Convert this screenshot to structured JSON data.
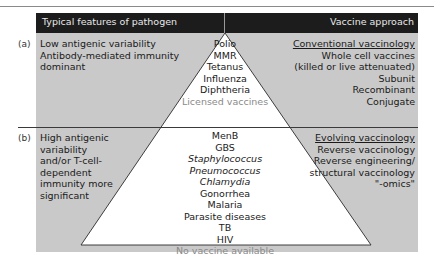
{
  "header": {
    "left": "Typical features of pathogen",
    "right": "Vaccine approach"
  },
  "rows": [
    {
      "marker": "(a)",
      "features": [
        "Low antigenic variability",
        "Antibody-mediated immunity dominant"
      ],
      "pathogens": [
        {
          "name": "Polio",
          "italic": false
        },
        {
          "name": "MMR",
          "italic": false
        },
        {
          "name": "Tetanus",
          "italic": false
        },
        {
          "name": "Influenza",
          "italic": false
        },
        {
          "name": "Diphtheria",
          "italic": false
        }
      ],
      "pathogens_footer": "Licensed vaccines",
      "approach_heading": "Conventional vaccinology",
      "approaches": [
        "Whole cell vaccines",
        "(killed or live attenuated)",
        "Subunit",
        "Recombinant",
        "Conjugate"
      ]
    },
    {
      "marker": "(b)",
      "features": [
        "High antigenic variability",
        "and/or T-cell-dependent",
        "immunity more",
        "significant"
      ],
      "pathogens": [
        {
          "name": "MenB",
          "italic": false
        },
        {
          "name": "GBS",
          "italic": false
        },
        {
          "name": "Staphylococcus",
          "italic": true
        },
        {
          "name": "Pneumococcus",
          "italic": true
        },
        {
          "name": "Chlamydia",
          "italic": true
        },
        {
          "name": "Gonorrhea",
          "italic": false
        },
        {
          "name": "Malaria",
          "italic": false
        },
        {
          "name": "Parasite diseases",
          "italic": false
        },
        {
          "name": "TB",
          "italic": false
        },
        {
          "name": "HIV",
          "italic": false
        }
      ],
      "pathogens_footer": "No vaccine available",
      "approach_heading": "Evolving vaccinology",
      "approaches": [
        "Reverse vaccinology",
        "Reverse engineering/",
        "structural vaccinology",
        "\"-omics\""
      ]
    }
  ],
  "colors": {
    "panel": "#c9c9c9",
    "header": "#1c1c1c",
    "triangle": "#ffffff",
    "footer_text": "#8a8a8a"
  }
}
